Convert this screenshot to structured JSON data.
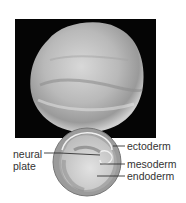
{
  "figure": {
    "photo_alt": "embryo-photograph",
    "diagram_alt": "embryo-cross-section"
  },
  "labels": {
    "neural_plate_line1": "neural",
    "neural_plate_line2": "plate",
    "ectoderm": "ectoderm",
    "mesoderm": "mesoderm",
    "endoderm": "endoderm"
  },
  "colors": {
    "background": "#ffffff",
    "photo_bg": "#050505",
    "cross_section_outer": "#8a8a8a",
    "cross_section_inner": "#c8c8c8",
    "leader_line": "#333333"
  }
}
